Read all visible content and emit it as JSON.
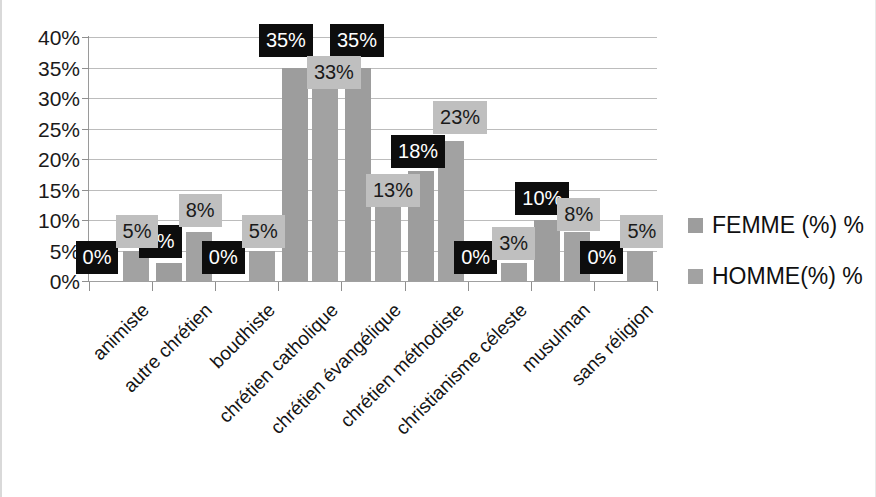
{
  "chart_data": {
    "type": "bar",
    "title": "",
    "subtitle": "",
    "xlabel": "",
    "ylabel": "",
    "ylim": [
      0,
      40
    ],
    "grid": true,
    "legend_position": "right",
    "y_tick_labels": [
      "40%",
      "35%",
      "30%",
      "25%",
      "20%",
      "15%",
      "10%",
      "5%",
      "0%"
    ],
    "y_tick_values": [
      40,
      35,
      30,
      25,
      20,
      15,
      10,
      5,
      0
    ],
    "categories": [
      "animiste",
      "autre chrétien",
      "boudhiste",
      "chrétien catholique",
      "chrétien évangélique",
      "chrétien méthodiste",
      "christianisme céleste",
      "musulman",
      "sans réligion"
    ],
    "series": [
      {
        "name": "FEMME (%) %",
        "color": "#9d9d9d",
        "label_background": "#0d0d0d",
        "label_color": "#ffffff",
        "values": [
          0,
          3,
          0,
          35,
          35,
          18,
          0,
          10,
          0
        ],
        "value_labels": [
          "0%",
          "3%",
          "0%",
          "35%",
          "35%",
          "18%",
          "0%",
          "10%",
          "0%"
        ]
      },
      {
        "name": "HOMME(%) %",
        "color": "#a2a2a2",
        "label_background": "#bfbfbf",
        "label_color": "#1a1a1a",
        "values": [
          5,
          8,
          5,
          33,
          13,
          23,
          3,
          8,
          5
        ],
        "value_labels": [
          "5%",
          "8%",
          "5%",
          "33%",
          "13%",
          "23%",
          "3%",
          "8%",
          "5%"
        ]
      }
    ]
  },
  "legend": {
    "items": [
      {
        "label": "FEMME (%) %",
        "swatch": "#9d9d9d"
      },
      {
        "label": "HOMME(%) %",
        "swatch": "#a2a2a2"
      }
    ]
  }
}
